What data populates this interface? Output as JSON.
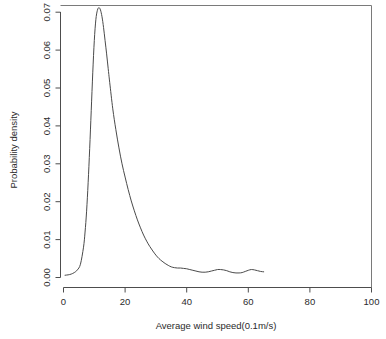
{
  "chart_data": {
    "type": "line",
    "title": "",
    "subtitle": "",
    "xlabel": "Average wind speed(0.1m/s)",
    "ylabel": "Probability density",
    "xlim": [
      0,
      100
    ],
    "ylim": [
      0.0,
      0.0715
    ],
    "grid": false,
    "legend": null,
    "xticks": [
      0,
      20,
      40,
      60,
      80,
      100
    ],
    "xtick_labels": [
      "0",
      "20",
      "40",
      "60",
      "80",
      "100"
    ],
    "yticks": [
      0.0,
      0.01,
      0.02,
      0.03,
      0.04,
      0.05,
      0.06,
      0.07
    ],
    "ytick_labels": [
      "0.00",
      "0.01",
      "0.02",
      "0.03",
      "0.04",
      "0.05",
      "0.06",
      "0.07"
    ],
    "series": [
      {
        "name": "Probability density of average wind speed",
        "x": [
          0.5,
          1.5,
          2.5,
          3.5,
          4.5,
          5.5,
          6.5,
          7.0,
          7.5,
          8.0,
          8.5,
          9.0,
          9.5,
          10.0,
          10.5,
          11.0,
          11.5,
          12.0,
          12.5,
          13.0,
          13.5,
          14.0,
          14.5,
          15.0,
          16.0,
          17.0,
          18.0,
          19.0,
          20.0,
          21.0,
          22.0,
          23.0,
          24.0,
          25.0,
          26.0,
          27.0,
          28.0,
          29.0,
          30.0,
          31.0,
          32.0,
          33.0,
          34.0,
          35.0,
          36.0,
          37.0,
          38.0,
          39.0,
          40.0,
          41.0,
          42.0,
          43.0,
          44.0,
          45.0,
          46.0,
          47.0,
          48.0,
          49.0,
          50.0,
          51.0,
          52.0,
          53.0,
          54.0,
          55.0,
          56.0,
          57.0,
          58.0,
          59.0,
          60.0,
          61.0,
          62.0,
          63.0,
          64.0,
          65.0
        ],
        "y": [
          0.0006,
          0.0007,
          0.0009,
          0.0013,
          0.002,
          0.0035,
          0.008,
          0.012,
          0.0175,
          0.025,
          0.034,
          0.044,
          0.054,
          0.0625,
          0.068,
          0.0705,
          0.0712,
          0.0706,
          0.0688,
          0.066,
          0.0625,
          0.059,
          0.0552,
          0.0515,
          0.0445,
          0.039,
          0.0342,
          0.03,
          0.0265,
          0.0232,
          0.0202,
          0.0176,
          0.0152,
          0.0131,
          0.0112,
          0.0096,
          0.0082,
          0.007,
          0.0059,
          0.005,
          0.0043,
          0.0037,
          0.0032,
          0.0028,
          0.0026,
          0.0025,
          0.0025,
          0.0024,
          0.0023,
          0.0021,
          0.0019,
          0.0017,
          0.0015,
          0.0014,
          0.0014,
          0.0015,
          0.0017,
          0.0019,
          0.0021,
          0.0021,
          0.002,
          0.0018,
          0.0015,
          0.0013,
          0.0012,
          0.0012,
          0.0013,
          0.0016,
          0.0019,
          0.0021,
          0.002,
          0.0018,
          0.0016,
          0.0015
        ]
      }
    ],
    "annotations": []
  },
  "axes": {
    "x_title": "Average wind speed(0.1m/s)",
    "y_title": "Probability density",
    "x_tick_labels": [
      "0",
      "20",
      "40",
      "60",
      "80",
      "100"
    ],
    "y_tick_labels": [
      "0.00",
      "0.01",
      "0.02",
      "0.03",
      "0.04",
      "0.05",
      "0.06",
      "0.07"
    ]
  },
  "colors": {
    "curve": "#4a4a4a",
    "axis": "#4d4d4d",
    "frame": "#7a7a7a",
    "text": "#2b2b2b",
    "background": "#ffffff"
  }
}
